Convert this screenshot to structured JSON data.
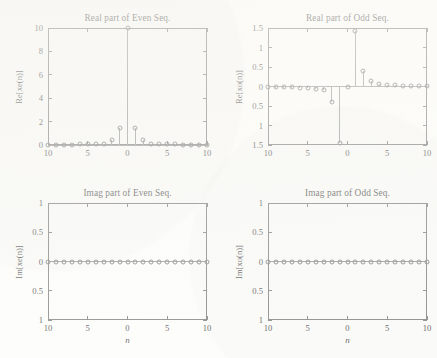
{
  "figure": {
    "background_color": "#fdfdfb",
    "axis_color": "#6e6e6e",
    "stem_color": "#8a8a8a",
    "marker_color": "#6b6b6b"
  },
  "chart_data": [
    {
      "id": "real-even",
      "type": "line",
      "title": "Real part of Even Seq.",
      "xlabel": "",
      "ylabel": "Re[xe(n)]",
      "xlim": [
        -10,
        10
      ],
      "ylim": [
        0,
        10
      ],
      "grid": false,
      "legend": "none",
      "xticks": [
        -10,
        -5,
        0,
        5,
        10
      ],
      "xticklabels": [
        "10",
        "5",
        "0",
        "5",
        "10"
      ],
      "yticks": [
        0,
        2,
        4,
        6,
        8,
        10
      ],
      "yticklabels": [
        "0",
        "2",
        "4",
        "6",
        "8",
        "10"
      ],
      "x": [
        -10,
        -9,
        -8,
        -7,
        -6,
        -5,
        -4,
        -3,
        -2,
        -1,
        0,
        1,
        2,
        3,
        4,
        5,
        6,
        7,
        8,
        9,
        10
      ],
      "values": [
        0.02,
        0.02,
        0.03,
        0.04,
        0.05,
        0.06,
        0.08,
        0.12,
        0.4,
        1.45,
        10,
        1.45,
        0.4,
        0.12,
        0.08,
        0.06,
        0.05,
        0.04,
        0.03,
        0.02,
        0.02
      ]
    },
    {
      "id": "real-odd",
      "type": "line",
      "title": "Real part of Odd Seq.",
      "xlabel": "",
      "ylabel": "Re[xo(n)]",
      "xlim": [
        -10,
        10
      ],
      "ylim": [
        -1.5,
        1.5
      ],
      "grid": false,
      "legend": "none",
      "xticks": [
        -10,
        -5,
        0,
        5,
        10
      ],
      "xticklabels": [
        "10",
        "5",
        "0",
        "5",
        "10"
      ],
      "yticks": [
        -1.5,
        -1,
        -0.5,
        0,
        0.5,
        1,
        1.5
      ],
      "yticklabels": [
        "1.5",
        "1",
        "0.5",
        "0",
        "0.5",
        "1",
        "1.5"
      ],
      "x": [
        -10,
        -9,
        -8,
        -7,
        -6,
        -5,
        -4,
        -3,
        -2,
        -1,
        0,
        1,
        2,
        3,
        4,
        5,
        6,
        7,
        8,
        9,
        10
      ],
      "values": [
        -0.01,
        -0.01,
        -0.02,
        -0.02,
        -0.03,
        -0.04,
        -0.06,
        -0.1,
        -0.41,
        -1.45,
        0,
        1.42,
        0.41,
        0.13,
        0.06,
        0.04,
        0.03,
        0.02,
        0.02,
        0.01,
        0.01
      ]
    },
    {
      "id": "imag-even",
      "type": "line",
      "title": "Imag part of Even Seq.",
      "xlabel": "n",
      "ylabel": "Im[xe(n)]",
      "xlim": [
        -10,
        10
      ],
      "ylim": [
        -1,
        1
      ],
      "grid": false,
      "legend": "none",
      "xticks": [
        -10,
        -5,
        0,
        5,
        10
      ],
      "xticklabels": [
        "10",
        "5",
        "0",
        "5",
        "10"
      ],
      "yticks": [
        -1,
        -0.5,
        0,
        0.5,
        1
      ],
      "yticklabels": [
        "1",
        "0.5",
        "0",
        "0.5",
        "1"
      ],
      "x": [
        -10,
        -9,
        -8,
        -7,
        -6,
        -5,
        -4,
        -3,
        -2,
        -1,
        0,
        1,
        2,
        3,
        4,
        5,
        6,
        7,
        8,
        9,
        10
      ],
      "values": [
        0,
        0,
        0,
        0,
        0,
        0,
        0,
        0,
        0,
        0,
        0,
        0,
        0,
        0,
        0,
        0,
        0,
        0,
        0,
        0,
        0
      ]
    },
    {
      "id": "imag-odd",
      "type": "line",
      "title": "Imag part of Odd Seq.",
      "xlabel": "n",
      "ylabel": "Im[xo(n)]",
      "xlim": [
        -10,
        10
      ],
      "ylim": [
        -1,
        1
      ],
      "grid": false,
      "legend": "none",
      "xticks": [
        -10,
        -5,
        0,
        5,
        10
      ],
      "xticklabels": [
        "10",
        "5",
        "0",
        "5",
        "10"
      ],
      "yticks": [
        -1,
        -0.5,
        0,
        0.5,
        1
      ],
      "yticklabels": [
        "1",
        "0.5",
        "0",
        "0.5",
        "1"
      ],
      "x": [
        -10,
        -9,
        -8,
        -7,
        -6,
        -5,
        -4,
        -3,
        -2,
        -1,
        0,
        1,
        2,
        3,
        4,
        5,
        6,
        7,
        8,
        9,
        10
      ],
      "values": [
        0,
        0,
        0,
        0,
        0,
        0,
        0,
        0,
        0,
        0,
        0,
        0,
        0,
        0,
        0,
        0,
        0,
        0,
        0,
        0,
        0
      ]
    }
  ]
}
